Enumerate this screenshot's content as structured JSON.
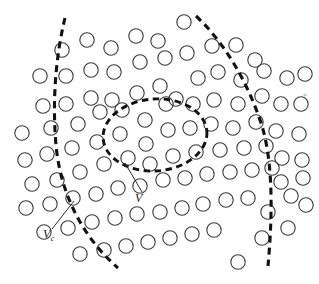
{
  "figure": {
    "background_color": "#ffffff",
    "width": 319,
    "height": 284,
    "particle": {
      "shape": "circle",
      "radius": 7.2,
      "stroke_color": "#3a3a3a",
      "fill": "none",
      "count": 96,
      "positions": [
        [
          62,
          50
        ],
        [
          87,
          40
        ],
        [
          111,
          48
        ],
        [
          136,
          36
        ],
        [
          158,
          41
        ],
        [
          184,
          22
        ],
        [
          40,
          76
        ],
        [
          66,
          76
        ],
        [
          91,
          70
        ],
        [
          114,
          72
        ],
        [
          140,
          62
        ],
        [
          165,
          58
        ],
        [
          187,
          53
        ],
        [
          212,
          46
        ],
        [
          236,
          45
        ],
        [
          255,
          60
        ],
        [
          287,
          78
        ],
        [
          305,
          74
        ],
        [
          43,
          106
        ],
        [
          66,
          104
        ],
        [
          91,
          98
        ],
        [
          112,
          100
        ],
        [
          137,
          93
        ],
        [
          160,
          86
        ],
        [
          176,
          99
        ],
        [
          198,
          78
        ],
        [
          218,
          72
        ],
        [
          241,
          80
        ],
        [
          264,
          71
        ],
        [
          281,
          104
        ],
        [
          301,
          104
        ],
        [
          22,
          133
        ],
        [
          51,
          128
        ],
        [
          78,
          124
        ],
        [
          100,
          112
        ],
        [
          122,
          110
        ],
        [
          145,
          120
        ],
        [
          166,
          104
        ],
        [
          193,
          104
        ],
        [
          214,
          100
        ],
        [
          238,
          104
        ],
        [
          262,
          96
        ],
        [
          276,
          131
        ],
        [
          299,
          134
        ],
        [
          25,
          160
        ],
        [
          47,
          154
        ],
        [
          72,
          148
        ],
        [
          97,
          142
        ],
        [
          120,
          134
        ],
        [
          146,
          144
        ],
        [
          168,
          130
        ],
        [
          190,
          128
        ],
        [
          211,
          124
        ],
        [
          233,
          128
        ],
        [
          256,
          122
        ],
        [
          282,
          158
        ],
        [
          302,
          160
        ],
        [
          32,
          184
        ],
        [
          57,
          180
        ],
        [
          80,
          172
        ],
        [
          104,
          164
        ],
        [
          128,
          158
        ],
        [
          150,
          164
        ],
        [
          173,
          156
        ],
        [
          196,
          152
        ],
        [
          220,
          150
        ],
        [
          244,
          148
        ],
        [
          266,
          146
        ],
        [
          281,
          182
        ],
        [
          303,
          178
        ],
        [
          26,
          208
        ],
        [
          50,
          204
        ],
        [
          73,
          198
        ],
        [
          96,
          194
        ],
        [
          118,
          188
        ],
        [
          140,
          186
        ],
        [
          163,
          180
        ],
        [
          185,
          178
        ],
        [
          207,
          174
        ],
        [
          230,
          172
        ],
        [
          252,
          170
        ],
        [
          272,
          168
        ],
        [
          291,
          196
        ],
        [
          306,
          205
        ],
        [
          44,
          232
        ],
        [
          68,
          228
        ],
        [
          92,
          222
        ],
        [
          115,
          218
        ],
        [
          137,
          214
        ],
        [
          160,
          212
        ],
        [
          182,
          208
        ],
        [
          203,
          204
        ],
        [
          226,
          200
        ],
        [
          248,
          198
        ],
        [
          268,
          212
        ],
        [
          288,
          228
        ],
        [
          80,
          254
        ],
        [
          104,
          250
        ],
        [
          126,
          246
        ],
        [
          148,
          242
        ],
        [
          170,
          238
        ],
        [
          192,
          234
        ],
        [
          214,
          230
        ],
        [
          238,
          262
        ],
        [
          262,
          238
        ]
      ]
    },
    "outer_boundary_left": {
      "name": "crack-boundary-left",
      "style": "dashed",
      "path": "M 65,18 C 56,55 52,100 56,145 C 60,190 80,235 118,268"
    },
    "outer_boundary_right": {
      "name": "crack-boundary-right",
      "style": "dashed",
      "path": "M 196,16 C 224,42 248,82 262,126 C 274,166 272,222 268,266"
    },
    "inner_boundary": {
      "name": "rve-ellipse",
      "style": "dashed",
      "cx": 155,
      "cy": 135,
      "rx": 52,
      "ry": 36,
      "rotation": -4
    },
    "labels": [
      {
        "id": "label-v",
        "symbol": "V",
        "subscript": "",
        "x": 135,
        "y": 202,
        "leader_path": "M 142,192 L 125,163"
      },
      {
        "id": "label-vc",
        "symbol": "V",
        "subscript": "c",
        "x": 43,
        "y": 238,
        "leader_path": "M 52,229 L 74,201"
      }
    ],
    "speck": {
      "x": 305,
      "y": 95,
      "r": 1.6
    }
  }
}
